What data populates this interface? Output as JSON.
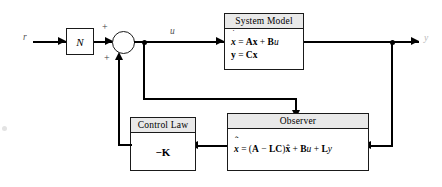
{
  "diagram": {
    "width": 442,
    "height": 187,
    "background": "#ffffff",
    "line_color": "#000000",
    "header_fill": "#e9e9e9"
  },
  "signals": {
    "reference": "r",
    "control": "u",
    "output": "y"
  },
  "summing_junction": {
    "name": "summing-junction",
    "sign_top": "+",
    "sign_bottom": "+"
  },
  "blocks": {
    "gain": {
      "label": "N"
    },
    "system_model": {
      "header": "System Model",
      "equation_1_lhs_state": "x",
      "equation_1_dot": "˙",
      "equation_1": "= Ax + Bu",
      "equation_2": "y = Cx"
    },
    "control_law": {
      "header": "Control Law",
      "gain": "−K"
    },
    "observer": {
      "header": "Observer",
      "state_symbol": "x",
      "state_hat": "ˆ",
      "state_dot": "˙",
      "equation": "= (A − LC)x̂ + Bu + Ly",
      "eq_part_open": "= (",
      "eq_matrix_a": "A",
      "eq_minus": "−",
      "eq_matrix_lc": "LC",
      "eq_close": ")",
      "eq_xhat": "x",
      "eq_plus_1": "+",
      "eq_matrix_b": "B",
      "eq_u": "u",
      "eq_plus_2": "+",
      "eq_matrix_l": "L",
      "eq_y": "y"
    }
  }
}
